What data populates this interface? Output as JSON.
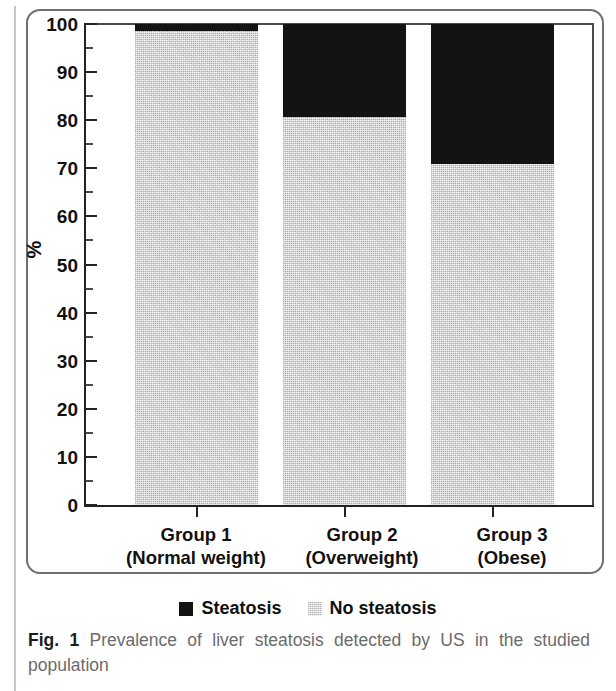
{
  "figure": {
    "label": "Fig. 1",
    "caption": "Prevalence of liver steatosis detected by US in the studied population"
  },
  "chart_data": {
    "type": "bar",
    "subtype": "stacked-100-percent",
    "title": "",
    "xlabel": "",
    "ylabel": "%",
    "ylim": [
      0,
      100
    ],
    "y_major_ticks": [
      0,
      10,
      20,
      30,
      40,
      50,
      60,
      70,
      80,
      90,
      100
    ],
    "y_minor_ticks": [
      5,
      15,
      25,
      35,
      45,
      55,
      65,
      75,
      85,
      95
    ],
    "grid": false,
    "legend_position": "bottom-center",
    "categories": [
      "Group 1 (Normal weight)",
      "Group 2 (Overweight)",
      "Group 3 (Obese)"
    ],
    "category_lines": [
      {
        "line1": "Group 1",
        "line2": "(Normal weight)"
      },
      {
        "line1": "Group 2",
        "line2": "(Overweight)"
      },
      {
        "line1": "Group 3",
        "line2": "(Obese)"
      }
    ],
    "series": [
      {
        "name": "Steatosis",
        "color": "#131313",
        "values": [
          1.5,
          19.3,
          29.0
        ]
      },
      {
        "name": "No steatosis",
        "color": "#cfcfcf",
        "values": [
          98.5,
          80.7,
          71.0
        ]
      }
    ]
  },
  "axis": {
    "y_title": "%",
    "y_tick_labels": [
      "100",
      "90",
      "80",
      "70",
      "60",
      "50",
      "40",
      "30",
      "20",
      "10",
      "0"
    ]
  },
  "legend": {
    "items": [
      {
        "label": "Steatosis",
        "swatch": "black-square-icon"
      },
      {
        "label": "No steatosis",
        "swatch": "grey-square-icon"
      }
    ]
  }
}
